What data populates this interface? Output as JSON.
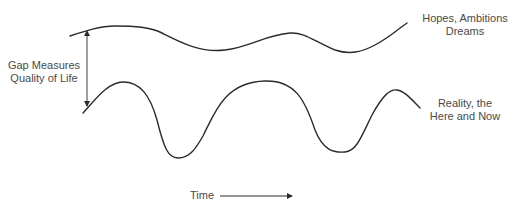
{
  "diagram": {
    "title": "",
    "curves": [
      {
        "id": "hopes-curve",
        "label_lines": [
          "Hopes, Ambitions",
          "Dreams"
        ],
        "path": "M 70 36 C 85 31, 100 26, 115 26 C 135 26, 150 27, 162 33 C 180 42, 200 53, 225 50 C 250 47, 265 35, 290 33 C 305 32, 315 42, 335 50 C 350 55, 362 52, 375 45 C 390 37, 398 29, 407 23"
      },
      {
        "id": "reality-curve",
        "label_lines": [
          "Reality, the",
          "Here and Now"
        ],
        "path": "M 83 113 C 95 100, 108 82, 123 82 C 140 82, 150 95, 157 120 C 164 148, 168 158, 178 158 C 190 158, 196 148, 203 136 C 215 112, 225 82, 265 81 C 295 80, 305 100, 315 130 C 323 150, 333 153, 345 152 C 357 151, 362 135, 372 115 C 383 95, 390 89, 397 90 C 405 91, 412 100, 420 108"
      }
    ],
    "gap_arrow": {
      "x": 87,
      "y_top": 35,
      "y_bottom": 106,
      "label_lines": [
        "Gap Measures",
        "Quality of Life"
      ]
    },
    "time_axis": {
      "label": "Time",
      "arrow_x_start": 220,
      "arrow_x_end": 292,
      "arrow_y": 196
    },
    "colors": {
      "stroke": "#2b2b2b",
      "text": "#4a4a4a",
      "background": "#ffffff"
    }
  }
}
